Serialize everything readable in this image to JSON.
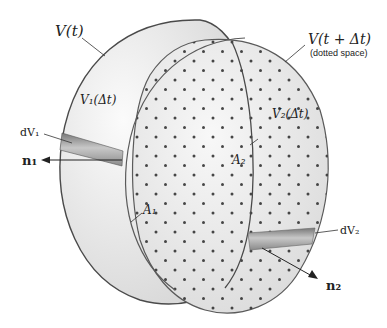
{
  "figure": {
    "labels": {
      "v_t": "V(t)",
      "v_t_dt": "V(t + Δt)",
      "dotted_space_note": "(dotted space)",
      "v1_dt": "V₁(Δt)",
      "v2_dt": "V₂(Δt)",
      "dv1": "dV₁",
      "dv2": "dV₂",
      "n1": "n₁",
      "n2": "n₂",
      "a1": "A₁",
      "a2": "A₂"
    },
    "colors": {
      "outline": "#555555",
      "fill_light": "#f2f2f2",
      "fill_shade": "#d8d8d8",
      "dot": "#333333",
      "tube": "#9a9a9a"
    }
  }
}
